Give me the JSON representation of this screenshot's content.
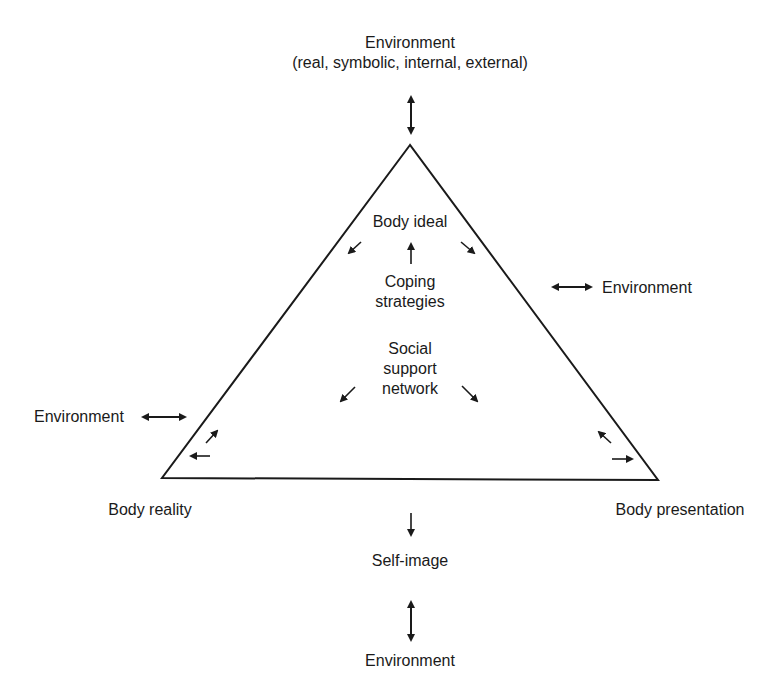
{
  "diagram": {
    "top": {
      "title": "Environment",
      "subtitle": "(real, symbolic, internal, external)"
    },
    "vertices": {
      "top": "Body ideal",
      "bottom_left": "Body reality",
      "bottom_right": "Body presentation"
    },
    "center": {
      "coping_line1": "Coping",
      "coping_line2": "strategies",
      "social_line1": "Social",
      "social_line2": "support",
      "social_line3": "network"
    },
    "environment_left": "Environment",
    "environment_right": "Environment",
    "self_image": "Self-image",
    "environment_bottom": "Environment",
    "colors": {
      "ink": "#1a1a1a",
      "background": "#ffffff"
    }
  }
}
